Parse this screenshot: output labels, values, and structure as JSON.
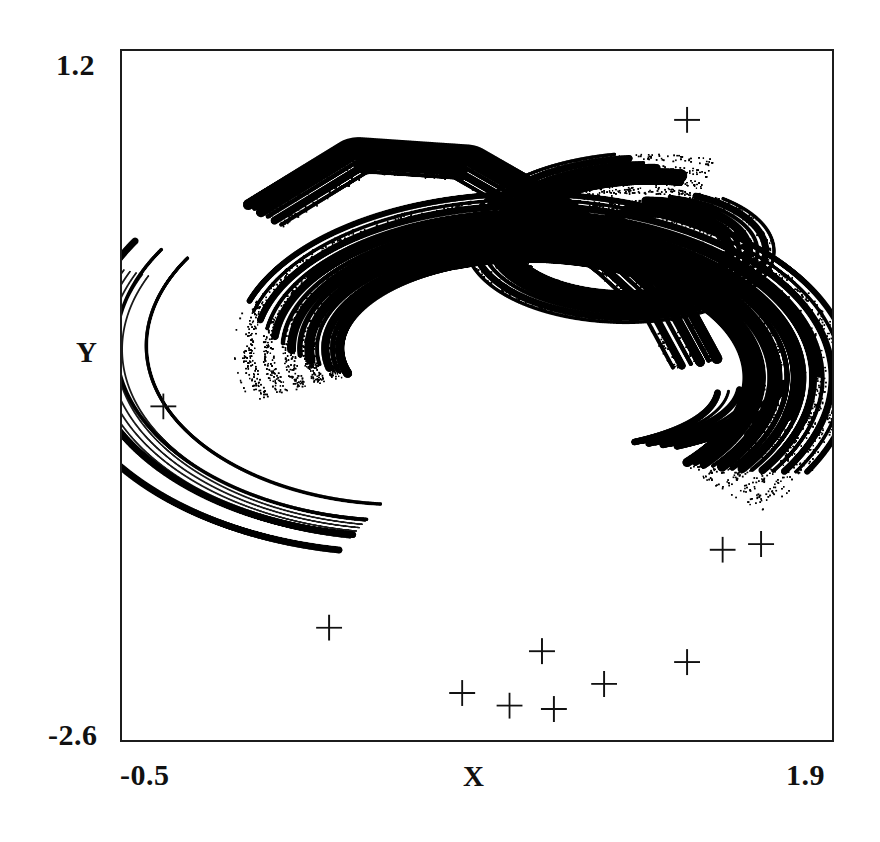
{
  "figure": {
    "kind": "strange-attractor-phase-portrait",
    "background": "#ffffff",
    "ink_color": "#000000",
    "frame_color": "#1c1c1c"
  },
  "axes": {
    "x_title": "X",
    "y_title": "Y",
    "x_min_label": "-0.5",
    "x_max_label": "1.9",
    "y_min_label": "-2.6",
    "y_max_label": "1.2"
  },
  "chart_data": {
    "type": "scatter",
    "title": "",
    "xlabel": "X",
    "ylabel": "Y",
    "xlim": [
      -0.5,
      1.9
    ],
    "ylim": [
      -2.6,
      1.2
    ],
    "xticks": [
      -0.5,
      1.9
    ],
    "yticks": [
      -2.6,
      1.2
    ],
    "xticklabels": [
      "-0.5",
      "1.9"
    ],
    "yticklabels": [
      "-2.6",
      "1.2"
    ],
    "grid": false,
    "legend": null,
    "series": [
      {
        "name": "attractor-orbit",
        "marker": "dot",
        "color": "#000000",
        "description": "Dense chaotic orbit forming a folded C-shaped spiral band with nested self-similar layers.",
        "point_count_estimate": 40000
      },
      {
        "name": "marked-points",
        "marker": "plus",
        "color": "#000000",
        "x": [
          1.41,
          -0.36,
          1.66,
          1.53,
          0.2,
          0.92,
          1.41,
          1.13,
          0.65,
          0.81,
          0.96
        ],
        "y": [
          0.82,
          -0.76,
          -1.52,
          -1.55,
          -1.98,
          -2.11,
          -2.17,
          -2.29,
          -2.34,
          -2.41,
          -2.43
        ]
      }
    ],
    "attractor": {
      "map": "ikeda-like",
      "band_count": 12,
      "notes": "Outer arm sweeps counter-clockwise from upper-left, folds into a tight inner spiral on the right, and trails into thin filaments toward the lower right."
    }
  }
}
